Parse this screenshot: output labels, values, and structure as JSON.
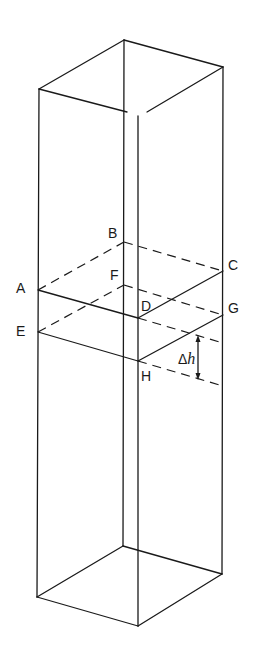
{
  "figure": {
    "labels": {
      "A": "A",
      "B": "B",
      "C": "C",
      "D": "D",
      "E": "E",
      "F": "F",
      "G": "G",
      "H": "H"
    },
    "delta_symbol": "Δ",
    "delta_var": "h",
    "colors": {
      "line": "#1a1a1a",
      "background": "#ffffff"
    }
  }
}
